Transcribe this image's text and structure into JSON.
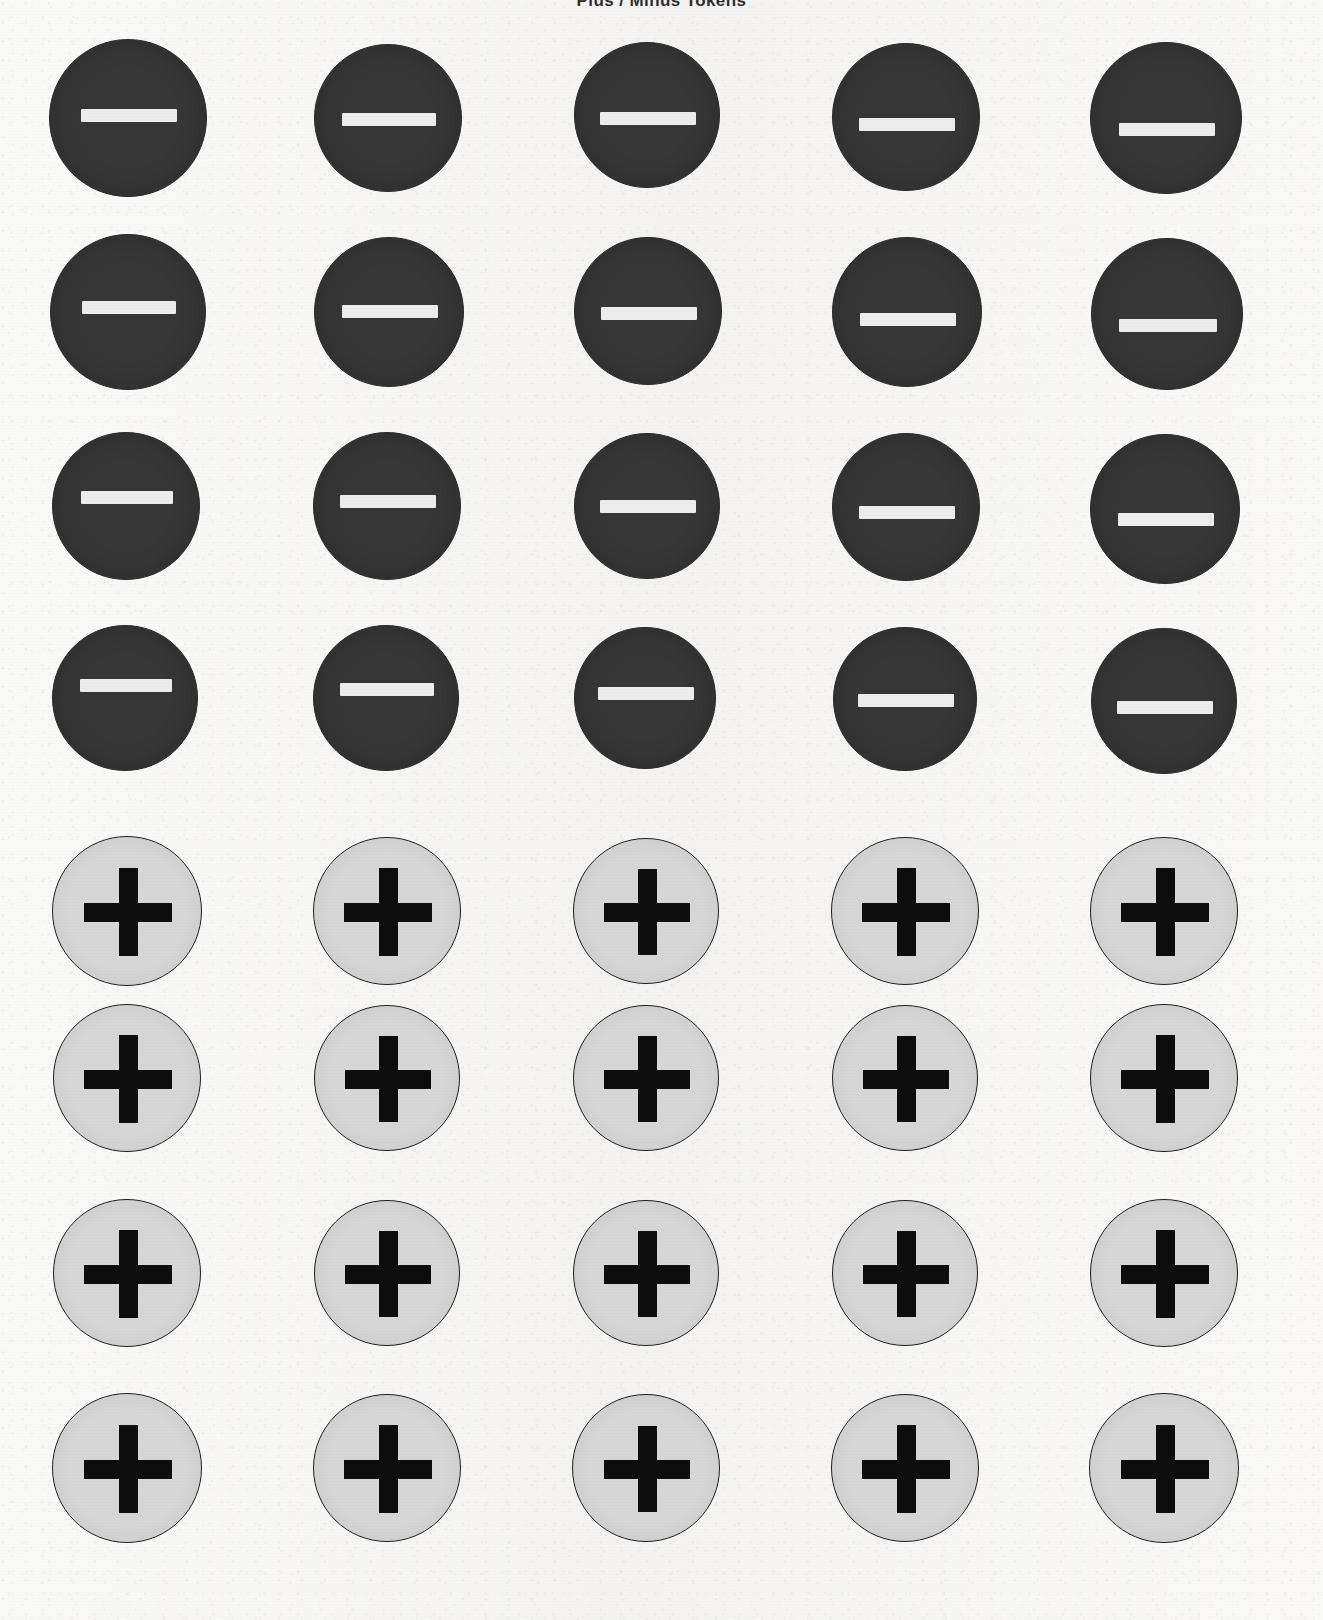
{
  "sheet": {
    "heading": "Plus / Minus Tokens",
    "heading_visible_fragment": "g",
    "background_color": "#f5f4f2",
    "width": 1323,
    "height": 1620,
    "rows": 8,
    "columns": 5,
    "total_tokens": 40
  },
  "styles": {
    "minus_token": {
      "fill_color": "#363636",
      "border_color": "#2a2a2a",
      "glyph_color": "#ececec",
      "diameter": 160,
      "glyph_name": "minus-icon",
      "glyph_label": "−",
      "bar_width": 96,
      "bar_height": 13
    },
    "plus_token": {
      "fill_color": "#d6d6d6",
      "border_color": "#1e1e1e",
      "glyph_color": "#0d0d0d",
      "diameter": 150,
      "glyph_name": "plus-icon",
      "glyph_label": "+",
      "arm_length": 88,
      "stroke_thickness": 19
    }
  },
  "layout": {
    "column_centers": [
      128,
      388,
      646,
      905,
      1164
    ],
    "row_centers": [
      118,
      313,
      508,
      700,
      911,
      1078,
      1273,
      1468
    ],
    "minus_row_indices": [
      0,
      1,
      2,
      3
    ],
    "plus_row_indices": [
      4,
      5,
      6,
      7
    ]
  },
  "tokens": [
    {
      "row": 0,
      "col": 0,
      "type": "minus",
      "cx": 128,
      "cy": 118,
      "d": 158,
      "glyph_dy": -4,
      "bar_w": 96,
      "bar_h": 13
    },
    {
      "row": 0,
      "col": 1,
      "type": "minus",
      "cx": 388,
      "cy": 118,
      "d": 148,
      "glyph_dy": 0,
      "bar_w": 94,
      "bar_h": 13
    },
    {
      "row": 0,
      "col": 2,
      "type": "minus",
      "cx": 647,
      "cy": 115,
      "d": 146,
      "glyph_dy": 2,
      "bar_w": 96,
      "bar_h": 13
    },
    {
      "row": 0,
      "col": 3,
      "type": "minus",
      "cx": 906,
      "cy": 117,
      "d": 148,
      "glyph_dy": 6,
      "bar_w": 96,
      "bar_h": 13
    },
    {
      "row": 0,
      "col": 4,
      "type": "minus",
      "cx": 1166,
      "cy": 118,
      "d": 152,
      "glyph_dy": 10,
      "bar_w": 96,
      "bar_h": 13
    },
    {
      "row": 1,
      "col": 0,
      "type": "minus",
      "cx": 128,
      "cy": 312,
      "d": 156,
      "glyph_dy": -6,
      "bar_w": 94,
      "bar_h": 13
    },
    {
      "row": 1,
      "col": 1,
      "type": "minus",
      "cx": 389,
      "cy": 312,
      "d": 150,
      "glyph_dy": -2,
      "bar_w": 96,
      "bar_h": 13
    },
    {
      "row": 1,
      "col": 2,
      "type": "minus",
      "cx": 648,
      "cy": 311,
      "d": 148,
      "glyph_dy": 1,
      "bar_w": 96,
      "bar_h": 13
    },
    {
      "row": 1,
      "col": 3,
      "type": "minus",
      "cx": 907,
      "cy": 312,
      "d": 150,
      "glyph_dy": 6,
      "bar_w": 96,
      "bar_h": 13
    },
    {
      "row": 1,
      "col": 4,
      "type": "minus",
      "cx": 1167,
      "cy": 314,
      "d": 152,
      "glyph_dy": 10,
      "bar_w": 98,
      "bar_h": 13
    },
    {
      "row": 2,
      "col": 0,
      "type": "minus",
      "cx": 126,
      "cy": 506,
      "d": 148,
      "glyph_dy": -10,
      "bar_w": 92,
      "bar_h": 13
    },
    {
      "row": 2,
      "col": 1,
      "type": "minus",
      "cx": 387,
      "cy": 506,
      "d": 148,
      "glyph_dy": -6,
      "bar_w": 96,
      "bar_h": 13
    },
    {
      "row": 2,
      "col": 2,
      "type": "minus",
      "cx": 647,
      "cy": 506,
      "d": 146,
      "glyph_dy": -1,
      "bar_w": 96,
      "bar_h": 13
    },
    {
      "row": 2,
      "col": 3,
      "type": "minus",
      "cx": 906,
      "cy": 507,
      "d": 148,
      "glyph_dy": 4,
      "bar_w": 96,
      "bar_h": 13
    },
    {
      "row": 2,
      "col": 4,
      "type": "minus",
      "cx": 1165,
      "cy": 509,
      "d": 150,
      "glyph_dy": 9,
      "bar_w": 96,
      "bar_h": 13
    },
    {
      "row": 3,
      "col": 0,
      "type": "minus",
      "cx": 125,
      "cy": 698,
      "d": 146,
      "glyph_dy": -14,
      "bar_w": 92,
      "bar_h": 13
    },
    {
      "row": 3,
      "col": 1,
      "type": "minus",
      "cx": 386,
      "cy": 698,
      "d": 146,
      "glyph_dy": -10,
      "bar_w": 94,
      "bar_h": 13
    },
    {
      "row": 3,
      "col": 2,
      "type": "minus",
      "cx": 645,
      "cy": 698,
      "d": 142,
      "glyph_dy": -6,
      "bar_w": 96,
      "bar_h": 13
    },
    {
      "row": 3,
      "col": 3,
      "type": "minus",
      "cx": 905,
      "cy": 699,
      "d": 144,
      "glyph_dy": 0,
      "bar_w": 96,
      "bar_h": 13
    },
    {
      "row": 3,
      "col": 4,
      "type": "minus",
      "cx": 1164,
      "cy": 701,
      "d": 146,
      "glyph_dy": 5,
      "bar_w": 96,
      "bar_h": 13
    },
    {
      "row": 4,
      "col": 0,
      "type": "plus",
      "cx": 127,
      "cy": 911,
      "d": 150,
      "glyph_dy": 0,
      "arm": 88,
      "thick": 19
    },
    {
      "row": 4,
      "col": 1,
      "type": "plus",
      "cx": 387,
      "cy": 911,
      "d": 148,
      "glyph_dy": 0,
      "arm": 88,
      "thick": 19
    },
    {
      "row": 4,
      "col": 2,
      "type": "plus",
      "cx": 646,
      "cy": 911,
      "d": 146,
      "glyph_dy": 0,
      "arm": 86,
      "thick": 19
    },
    {
      "row": 4,
      "col": 3,
      "type": "plus",
      "cx": 905,
      "cy": 911,
      "d": 148,
      "glyph_dy": 0,
      "arm": 88,
      "thick": 19
    },
    {
      "row": 4,
      "col": 4,
      "type": "plus",
      "cx": 1164,
      "cy": 911,
      "d": 148,
      "glyph_dy": 0,
      "arm": 88,
      "thick": 19
    },
    {
      "row": 5,
      "col": 0,
      "type": "plus",
      "cx": 127,
      "cy": 1078,
      "d": 148,
      "glyph_dy": 0,
      "arm": 88,
      "thick": 19
    },
    {
      "row": 5,
      "col": 1,
      "type": "plus",
      "cx": 387,
      "cy": 1078,
      "d": 146,
      "glyph_dy": 0,
      "arm": 86,
      "thick": 19
    },
    {
      "row": 5,
      "col": 2,
      "type": "plus",
      "cx": 646,
      "cy": 1078,
      "d": 146,
      "glyph_dy": 0,
      "arm": 86,
      "thick": 19
    },
    {
      "row": 5,
      "col": 3,
      "type": "plus",
      "cx": 905,
      "cy": 1078,
      "d": 146,
      "glyph_dy": 0,
      "arm": 86,
      "thick": 19
    },
    {
      "row": 5,
      "col": 4,
      "type": "plus",
      "cx": 1164,
      "cy": 1078,
      "d": 148,
      "glyph_dy": 0,
      "arm": 88,
      "thick": 19
    },
    {
      "row": 6,
      "col": 0,
      "type": "plus",
      "cx": 127,
      "cy": 1273,
      "d": 148,
      "glyph_dy": 0,
      "arm": 88,
      "thick": 19
    },
    {
      "row": 6,
      "col": 1,
      "type": "plus",
      "cx": 387,
      "cy": 1273,
      "d": 146,
      "glyph_dy": 0,
      "arm": 86,
      "thick": 19
    },
    {
      "row": 6,
      "col": 2,
      "type": "plus",
      "cx": 646,
      "cy": 1273,
      "d": 146,
      "glyph_dy": 0,
      "arm": 86,
      "thick": 19
    },
    {
      "row": 6,
      "col": 3,
      "type": "plus",
      "cx": 905,
      "cy": 1273,
      "d": 146,
      "glyph_dy": 0,
      "arm": 86,
      "thick": 19
    },
    {
      "row": 6,
      "col": 4,
      "type": "plus",
      "cx": 1164,
      "cy": 1273,
      "d": 148,
      "glyph_dy": 0,
      "arm": 88,
      "thick": 19
    },
    {
      "row": 7,
      "col": 0,
      "type": "plus",
      "cx": 127,
      "cy": 1468,
      "d": 150,
      "glyph_dy": 0,
      "arm": 88,
      "thick": 19
    },
    {
      "row": 7,
      "col": 1,
      "type": "plus",
      "cx": 387,
      "cy": 1468,
      "d": 148,
      "glyph_dy": 0,
      "arm": 88,
      "thick": 19
    },
    {
      "row": 7,
      "col": 2,
      "type": "plus",
      "cx": 646,
      "cy": 1468,
      "d": 148,
      "glyph_dy": 0,
      "arm": 86,
      "thick": 19
    },
    {
      "row": 7,
      "col": 3,
      "type": "plus",
      "cx": 905,
      "cy": 1468,
      "d": 148,
      "glyph_dy": 0,
      "arm": 88,
      "thick": 19
    },
    {
      "row": 7,
      "col": 4,
      "type": "plus",
      "cx": 1164,
      "cy": 1468,
      "d": 150,
      "glyph_dy": 0,
      "arm": 88,
      "thick": 19
    }
  ]
}
